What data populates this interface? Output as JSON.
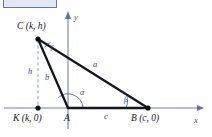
{
  "figure": {
    "colors": {
      "axis": "#6c7fb8",
      "triangle": "#161620",
      "dashed": "#8c9ccb",
      "label_math": "#3c4a7a",
      "label_point": "#16161f",
      "corner_box_fill": "#dfe6f2",
      "corner_box_stroke": "#47619e"
    },
    "axes": {
      "x_label": "x",
      "y_label": "y"
    },
    "points": [
      {
        "key": "C",
        "label": "C (k, h)",
        "x": 38,
        "y": 38,
        "dot": true
      },
      {
        "key": "K",
        "label": "K (k, 0)",
        "x": 38,
        "y": 108,
        "dot": true
      },
      {
        "key": "A",
        "label": "A",
        "x": 68,
        "y": 108,
        "dot": false
      },
      {
        "key": "B",
        "label": "B (c, 0)",
        "x": 148,
        "y": 108,
        "dot": true
      }
    ],
    "sides": [
      {
        "key": "a",
        "label": "a",
        "from": "C",
        "to": "B"
      },
      {
        "key": "b",
        "label": "b",
        "from": "C",
        "to": "A"
      },
      {
        "key": "c",
        "label": "c",
        "from": "A",
        "to": "B"
      },
      {
        "key": "h",
        "label": "h",
        "from": "C",
        "to": "K",
        "style": "dashed"
      }
    ],
    "angles": [
      {
        "key": "gamma",
        "label": "γ",
        "at": "C"
      },
      {
        "key": "alpha",
        "label": "α",
        "at": "A"
      },
      {
        "key": "beta",
        "label": "β",
        "at": "B"
      }
    ]
  }
}
